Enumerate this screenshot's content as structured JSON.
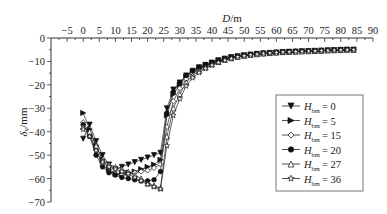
{
  "chart_data": {
    "type": "line",
    "title": "",
    "xlabel": "D/m",
    "ylabel": "δ_v/mm",
    "xlim": [
      -10,
      90
    ],
    "ylim": [
      -70,
      0
    ],
    "x_ticks": [
      -5,
      0,
      5,
      10,
      15,
      20,
      25,
      30,
      35,
      40,
      45,
      50,
      55,
      60,
      65,
      70,
      75,
      80,
      85,
      90
    ],
    "y_ticks": [
      0,
      -10,
      -20,
      -30,
      -40,
      -50,
      -60,
      -70
    ],
    "x_axis_position": "top",
    "grid": false,
    "legend_position": "lower right",
    "x": [
      0,
      2,
      4,
      6,
      8,
      10,
      12,
      14,
      16,
      18,
      20,
      22,
      24,
      26,
      28,
      30,
      32,
      34,
      36,
      38,
      40,
      42,
      44,
      46,
      48,
      50,
      52,
      54,
      56,
      58,
      60,
      62,
      64,
      66,
      68,
      70,
      72,
      74,
      76,
      78,
      80,
      82,
      84
    ],
    "series": [
      {
        "name": "H_bm = 0",
        "marker": "triangle-down-filled",
        "values": [
          -43,
          -37,
          -44,
          -50,
          -54,
          -56,
          -55,
          -54,
          -53,
          -52,
          -51,
          -50,
          -49,
          -30,
          -22,
          -19,
          -16,
          -14,
          -12.5,
          -11.5,
          -10.5,
          -9.5,
          -8.8,
          -8.2,
          -7.8,
          -7.4,
          -7.1,
          -6.8,
          -6.6,
          -6.4,
          -6.2,
          -6.0,
          -5.9,
          -5.8,
          -5.7,
          -5.6,
          -5.5,
          -5.4,
          -5.3,
          -5.2,
          -5.1,
          -5.0,
          -5.0
        ]
      },
      {
        "name": "H_bm = 5",
        "marker": "triangle-right-filled",
        "values": [
          -32,
          -39,
          -46,
          -52,
          -56,
          -58,
          -58,
          -57.5,
          -57,
          -56,
          -55,
          -54,
          -52,
          -33,
          -24,
          -20,
          -16.5,
          -14.5,
          -12.8,
          -11.6,
          -10.6,
          -9.7,
          -8.9,
          -8.3,
          -7.8,
          -7.4,
          -7.1,
          -6.8,
          -6.6,
          -6.4,
          -6.2,
          -6.0,
          -5.9,
          -5.8,
          -5.7,
          -5.6,
          -5.5,
          -5.4,
          -5.3,
          -5.2,
          -5.1,
          -5.0,
          -5.0
        ]
      },
      {
        "name": "H_bm = 15",
        "marker": "diamond-open",
        "values": [
          -36,
          -41,
          -48,
          -54,
          -57,
          -58,
          -58.5,
          -58,
          -57.5,
          -57,
          -56.5,
          -55.5,
          -54,
          -38,
          -27,
          -21.5,
          -17.5,
          -15,
          -13.2,
          -11.8,
          -10.8,
          -9.8,
          -9.0,
          -8.4,
          -7.9,
          -7.5,
          -7.1,
          -6.8,
          -6.6,
          -6.4,
          -6.2,
          -6.0,
          -5.9,
          -5.8,
          -5.7,
          -5.6,
          -5.5,
          -5.4,
          -5.3,
          -5.2,
          -5.1,
          -5.0,
          -5.0
        ]
      },
      {
        "name": "H_bm = 20",
        "marker": "circle-filled",
        "values": [
          -37,
          -42,
          -50,
          -55,
          -57.5,
          -58.5,
          -59.5,
          -60,
          -60.5,
          -61,
          -61,
          -60.5,
          -57,
          -32,
          -23,
          -19,
          -16,
          -14,
          -12.5,
          -11.4,
          -10.5,
          -9.6,
          -8.9,
          -8.3,
          -7.8,
          -7.4,
          -7.1,
          -6.8,
          -6.6,
          -6.4,
          -6.2,
          -6.0,
          -5.9,
          -5.8,
          -5.7,
          -5.6,
          -5.5,
          -5.4,
          -5.3,
          -5.2,
          -5.1,
          -5.0,
          -5.0
        ]
      },
      {
        "name": "H_bm = 27",
        "marker": "triangle-up-open",
        "values": [
          -38,
          -40,
          -46,
          -52,
          -54,
          -55,
          -56,
          -57,
          -58.5,
          -60,
          -62,
          -63,
          -64,
          -42,
          -30,
          -24,
          -19,
          -16,
          -14,
          -12.5,
          -11.2,
          -10.2,
          -9.3,
          -8.6,
          -8.0,
          -7.6,
          -7.2,
          -6.9,
          -6.6,
          -6.4,
          -6.2,
          -6.0,
          -5.9,
          -5.8,
          -5.7,
          -5.6,
          -5.5,
          -5.4,
          -5.3,
          -5.2,
          -5.1,
          -5.0,
          -5.0
        ]
      },
      {
        "name": "H_bm = 36",
        "marker": "star-open",
        "values": [
          -39,
          -42,
          -48,
          -53,
          -55,
          -56,
          -57,
          -58,
          -59.5,
          -61,
          -62.5,
          -63.5,
          -64.5,
          -46,
          -33,
          -26,
          -20.5,
          -17,
          -14.8,
          -13,
          -11.6,
          -10.5,
          -9.5,
          -8.8,
          -8.1,
          -7.6,
          -7.2,
          -6.9,
          -6.6,
          -6.4,
          -6.2,
          -6.0,
          -5.9,
          -5.8,
          -5.7,
          -5.6,
          -5.5,
          -5.4,
          -5.3,
          -5.2,
          -5.1,
          -5.0,
          -5.0
        ]
      }
    ]
  },
  "axes": {
    "x_title_italic": "D",
    "x_title_unit": "/m",
    "y_title_italic": "δ",
    "y_title_sub": "v",
    "y_title_unit": "/mm"
  },
  "legend": {
    "items": [
      {
        "symbol": "H",
        "sub": "bm",
        "value": "= 0"
      },
      {
        "symbol": "H",
        "sub": "bm",
        "value": "= 5"
      },
      {
        "symbol": "H",
        "sub": "bm",
        "value": "= 15"
      },
      {
        "symbol": "H",
        "sub": "bm",
        "value": "= 20"
      },
      {
        "symbol": "H",
        "sub": "bm",
        "value": "= 27"
      },
      {
        "symbol": "H",
        "sub": "bm",
        "value": "= 36"
      }
    ]
  }
}
